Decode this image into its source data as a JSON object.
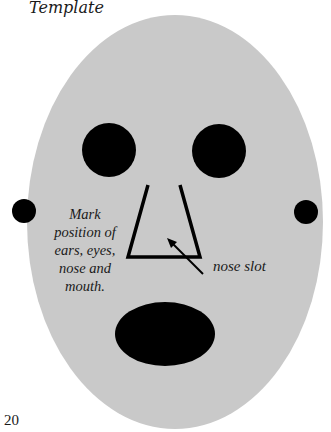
{
  "header": {
    "title": "Template"
  },
  "face": {
    "fill_color": "#c8c8c8",
    "feature_color": "#000000",
    "instruction": "Mark position of ears, eyes, nose and mouth.",
    "instruction_lines": [
      "Mark",
      "position of",
      "ears, eyes,",
      "nose and",
      "mouth."
    ],
    "nose_label": "nose slot"
  },
  "footer": {
    "page_number": "20"
  }
}
